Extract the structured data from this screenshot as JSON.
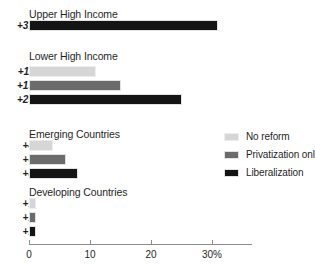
{
  "chart_data": {
    "type": "bar",
    "orientation": "horizontal",
    "title": "",
    "subtitle": "",
    "xlabel": "",
    "ylabel": "",
    "xlim": [
      0,
      36.5
    ],
    "xticks": [
      0,
      10,
      20,
      30
    ],
    "xtick_labels": [
      "0",
      "10",
      "20",
      "30%"
    ],
    "grid": false,
    "legend_position": "middle-right",
    "categories": [
      "Upper High Income",
      "Lower High Income",
      "Emerging Countries",
      "Developing Countries"
    ],
    "series": [
      {
        "name": "No reform",
        "color": "#d6d6d6",
        "values": [
          null,
          11,
          4,
          1
        ],
        "labels": [
          "",
          "+11",
          "+4",
          "+1"
        ]
      },
      {
        "name": "Privatization only",
        "color": "#6b6b6b",
        "values": [
          null,
          15,
          6,
          1
        ],
        "labels": [
          "",
          "+15",
          "+6",
          "+1"
        ]
      },
      {
        "name": "Liberalization",
        "color": "#141414",
        "values": [
          31,
          25,
          8,
          1
        ],
        "labels": [
          "+31",
          "+25",
          "+8",
          "+1"
        ]
      }
    ],
    "groups": [
      {
        "title": "Upper High Income",
        "bars": [
          {
            "label": "+31",
            "value": 31,
            "series": "Liberalization",
            "swatch": 2
          }
        ]
      },
      {
        "title": "Lower High Income",
        "bars": [
          {
            "label": "+11",
            "value": 11,
            "series": "No reform",
            "swatch": 0
          },
          {
            "label": "+15",
            "value": 15,
            "series": "Privatization only",
            "swatch": 1
          },
          {
            "label": "+25",
            "value": 25,
            "series": "Liberalization",
            "swatch": 2
          }
        ]
      },
      {
        "title": "Emerging Countries",
        "bars": [
          {
            "label": "+4",
            "value": 4,
            "series": "No reform",
            "swatch": 0
          },
          {
            "label": "+6",
            "value": 6,
            "series": "Privatization only",
            "swatch": 1
          },
          {
            "label": "+8",
            "value": 8,
            "series": "Liberalization",
            "swatch": 2
          }
        ]
      },
      {
        "title": "Developing Countries",
        "bars": [
          {
            "label": "+1",
            "value": 1,
            "series": "No reform",
            "swatch": 0
          },
          {
            "label": "+1",
            "value": 1,
            "series": "Privatization only",
            "swatch": 1
          },
          {
            "label": "+1",
            "value": 1,
            "series": "Liberalization",
            "swatch": 2
          }
        ]
      }
    ],
    "legend": [
      {
        "label": "No reform",
        "swatch": 0,
        "color": "#d6d6d6"
      },
      {
        "label": "Privatization only",
        "swatch": 1,
        "color": "#6b6b6b"
      },
      {
        "label": "Liberalization",
        "swatch": 2,
        "color": "#141414"
      }
    ]
  }
}
